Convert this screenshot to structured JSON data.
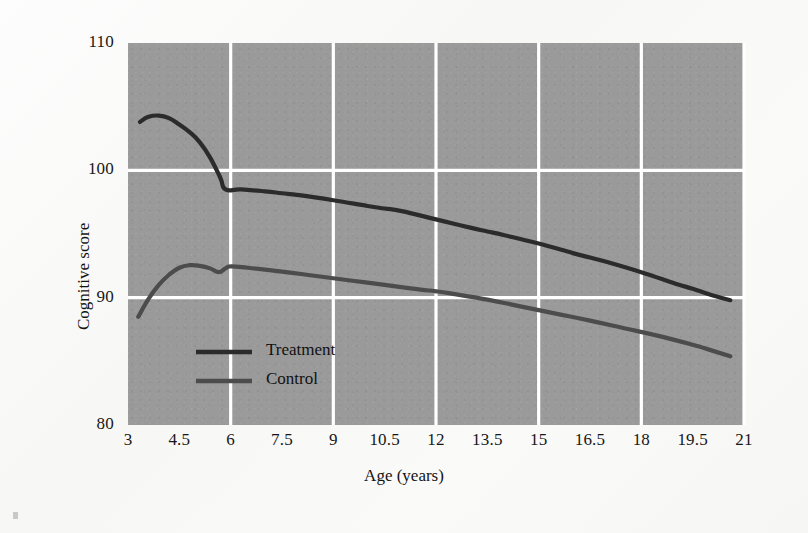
{
  "figure": {
    "background_color": "#fbfbfb",
    "plot_background_color": "#9a9a9a",
    "grid_color": "#ffffff"
  },
  "chart_data": {
    "type": "line",
    "title": "",
    "xlabel": "Age (years)",
    "ylabel": "Cognitive score",
    "xlim": [
      3,
      21
    ],
    "ylim": [
      80,
      110
    ],
    "xticks": [
      "3",
      "4.5",
      "6",
      "7.5",
      "9",
      "10.5",
      "12",
      "13.5",
      "15",
      "16.5",
      "18",
      "19.5",
      "21"
    ],
    "xtick_values": [
      3,
      4.5,
      6,
      7.5,
      9,
      10.5,
      12,
      13.5,
      15,
      16.5,
      18,
      19.5,
      21
    ],
    "yticks": [
      "80",
      "90",
      "100",
      "110"
    ],
    "ytick_values": [
      80,
      90,
      100,
      110
    ],
    "grid": true,
    "grid_x_values": [
      6,
      9,
      12,
      15,
      18,
      21
    ],
    "grid_y_values": [
      90,
      100
    ],
    "legend_position": "inside-lower-left",
    "series": [
      {
        "name": "Treatment",
        "color": "#2b2b2b",
        "linewidth": 4.2,
        "x": [
          3.35,
          3.6,
          3.9,
          4.2,
          4.5,
          4.8,
          5.1,
          5.4,
          5.7,
          5.85,
          6.3,
          7.0,
          7.5,
          8.0,
          9.0,
          10.0,
          10.5,
          11.0,
          12.0,
          13.0,
          13.5,
          14.0,
          15.0,
          16.0,
          16.5,
          17.0,
          18.0,
          19.0,
          19.5,
          20.0,
          20.6
        ],
        "y": [
          103.8,
          104.2,
          104.3,
          104.1,
          103.6,
          103.0,
          102.2,
          101.0,
          99.4,
          98.5,
          98.5,
          98.35,
          98.2,
          98.05,
          97.65,
          97.2,
          97.0,
          96.8,
          96.15,
          95.5,
          95.2,
          94.9,
          94.25,
          93.5,
          93.15,
          92.8,
          92.0,
          91.1,
          90.7,
          90.25,
          89.8
        ]
      },
      {
        "name": "Control",
        "color": "#4c4c4c",
        "linewidth": 4.2,
        "x": [
          3.3,
          3.6,
          3.9,
          4.2,
          4.5,
          4.8,
          5.1,
          5.4,
          5.65,
          5.85,
          6.0,
          6.5,
          7.5,
          8.5,
          9.5,
          10.5,
          11.5,
          12.0,
          12.5,
          13.5,
          14.5,
          15.5,
          16.5,
          17.5,
          18.5,
          19.5,
          20.0,
          20.6
        ],
        "y": [
          88.5,
          89.9,
          91.0,
          91.8,
          92.35,
          92.55,
          92.5,
          92.3,
          92.0,
          92.3,
          92.45,
          92.35,
          92.05,
          91.7,
          91.35,
          91.0,
          90.65,
          90.5,
          90.3,
          89.85,
          89.3,
          88.75,
          88.2,
          87.6,
          87.0,
          86.3,
          85.9,
          85.4
        ]
      }
    ]
  },
  "legend": {
    "items": [
      {
        "label": "Treatment",
        "color": "#2b2b2b"
      },
      {
        "label": "Control",
        "color": "#4c4c4c"
      }
    ]
  }
}
